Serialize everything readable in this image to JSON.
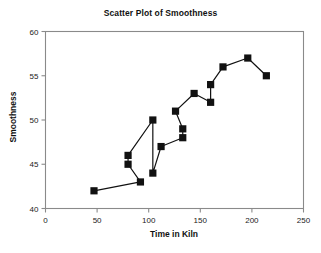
{
  "chart_data": {
    "type": "scatter",
    "title": "Scatter Plot of Smoothness",
    "xlabel": "Time in Kiln",
    "ylabel": "Smoothness",
    "xlim": [
      0,
      250
    ],
    "ylim": [
      40,
      60
    ],
    "xticks": [
      0,
      50,
      100,
      150,
      200,
      250
    ],
    "yticks": [
      40,
      45,
      50,
      55,
      60
    ],
    "grid": false,
    "legend": null,
    "connected": true,
    "marker": "square",
    "marker_color": "#111111",
    "line_color": "#111111",
    "x": [
      47,
      80,
      80,
      92,
      104,
      112,
      126,
      133,
      133,
      104,
      144,
      160,
      160,
      172,
      196,
      214
    ],
    "y": [
      42,
      46,
      45,
      43,
      44,
      47,
      51,
      49,
      48,
      50,
      53,
      54,
      52,
      56,
      57,
      55
    ],
    "points": [
      {
        "x": 47,
        "y": 42
      },
      {
        "x": 80,
        "y": 46
      },
      {
        "x": 80,
        "y": 45
      },
      {
        "x": 92,
        "y": 43
      },
      {
        "x": 104,
        "y": 44
      },
      {
        "x": 112,
        "y": 47
      },
      {
        "x": 126,
        "y": 51
      },
      {
        "x": 133,
        "y": 49
      },
      {
        "x": 133,
        "y": 48
      },
      {
        "x": 104,
        "y": 50
      },
      {
        "x": 144,
        "y": 53
      },
      {
        "x": 160,
        "y": 54
      },
      {
        "x": 160,
        "y": 52
      },
      {
        "x": 172,
        "y": 56
      },
      {
        "x": 196,
        "y": 57
      },
      {
        "x": 214,
        "y": 55
      }
    ],
    "path_order": [
      0,
      3,
      2,
      1,
      9,
      4,
      5,
      8,
      7,
      6,
      10,
      12,
      11,
      13,
      14,
      15
    ]
  },
  "axis": {
    "xtick_labels": [
      "0",
      "50",
      "100",
      "150",
      "200",
      "250"
    ],
    "ytick_labels": [
      "40",
      "45",
      "50",
      "55",
      "60"
    ]
  }
}
